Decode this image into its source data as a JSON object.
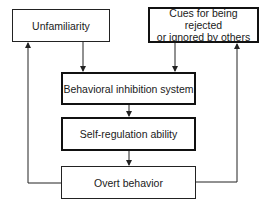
{
  "diagram": {
    "nodes": {
      "unfamiliarity": {
        "label": "Unfamiliarity"
      },
      "cues": {
        "label": "Cues for being rejected or ignored by others",
        "line1": "Cues for being rejected",
        "line2": "or ignored by others"
      },
      "bis": {
        "label": "Behavioral inhibition system"
      },
      "self_regulation": {
        "label": "Self-regulation ability"
      },
      "overt_behavior": {
        "label": "Overt behavior"
      }
    },
    "edges": [
      {
        "from": "Unfamiliarity",
        "to": "Behavioral inhibition system"
      },
      {
        "from": "Cues for being rejected or ignored by others",
        "to": "Behavioral inhibition system"
      },
      {
        "from": "Behavioral inhibition system",
        "to": "Self-regulation ability"
      },
      {
        "from": "Self-regulation ability",
        "to": "Overt behavior"
      },
      {
        "from": "Overt behavior",
        "to": "Unfamiliarity"
      },
      {
        "from": "Overt behavior",
        "to": "Cues for being rejected or ignored by others"
      }
    ],
    "colors": {
      "line": "#222222",
      "background": "#ffffff"
    }
  }
}
